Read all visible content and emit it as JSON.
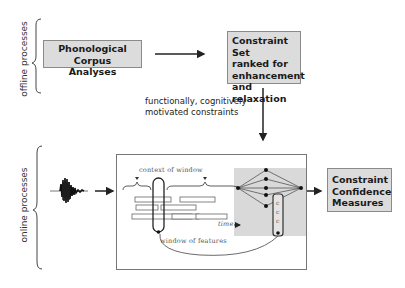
{
  "sections": {
    "offline": {
      "label": "offline processes"
    },
    "online": {
      "label": "online processes"
    }
  },
  "boxes": {
    "corpus": {
      "line1": "Phonological Corpus",
      "line2": "Analyses"
    },
    "constraint_set": {
      "line1": "Constraint Set",
      "line2": "ranked for",
      "line3": "enhancement",
      "line4": "and relaxation"
    },
    "confidence": {
      "line1": "Constraint",
      "line2": "Confidence",
      "line3": "Measures"
    }
  },
  "annotations": {
    "motivation_line1": "functionally, cognitively",
    "motivation_line2": "motivated constraints"
  },
  "panel": {
    "context_label": "context of window",
    "window_label": "window of features",
    "time_label": "time",
    "column_glyphs": [
      "c",
      "c",
      "c"
    ]
  },
  "colors": {
    "box_fill": "#dcdcdc",
    "box_border": "#8a8a8a",
    "panel_grey": "#d9d9d9",
    "ink": "#222222"
  }
}
